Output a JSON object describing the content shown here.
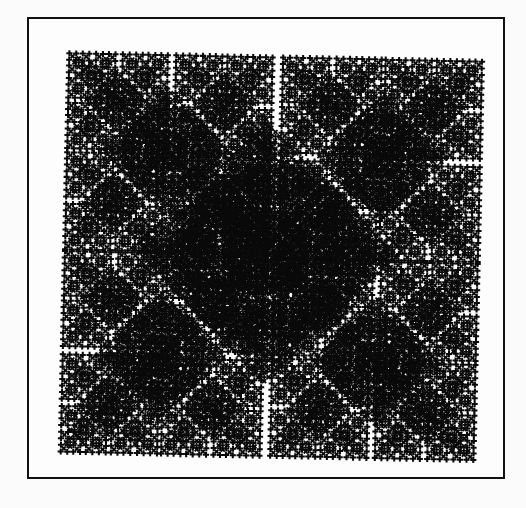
{
  "figure": {
    "colors": {
      "ink": "#0a0a0a",
      "background": "#fbfbfb",
      "frame": "#111111"
    },
    "ifs": {
      "levels": 6,
      "maps": [
        {
          "scale": 0.5,
          "rotate": 0,
          "tx": 0.05,
          "ty": 0.0
        },
        {
          "scale": 0.5,
          "rotate": 90,
          "tx": 1.0,
          "ty": 0.05
        },
        {
          "scale": 0.5,
          "rotate": 180,
          "tx": 0.95,
          "ty": 1.0
        },
        {
          "scale": 0.5,
          "rotate": 270,
          "tx": 0.0,
          "ty": 0.95
        }
      ]
    }
  }
}
